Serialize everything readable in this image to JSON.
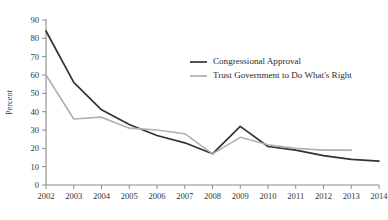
{
  "chart_data": {
    "type": "line",
    "title": "",
    "xlabel": "",
    "ylabel": "Percent",
    "x": [
      2002,
      2003,
      2004,
      2005,
      2006,
      2007,
      2008,
      2009,
      2010,
      2011,
      2012,
      2013,
      2014
    ],
    "xtick_labels": [
      "2002",
      "2003",
      "2004",
      "2005",
      "2006",
      "2007",
      "2008",
      "2009",
      "2010",
      "2011",
      "2012",
      "2013",
      "2014"
    ],
    "ytick_labels": [
      "0",
      "10",
      "20",
      "30",
      "40",
      "50",
      "60",
      "70",
      "80",
      "90"
    ],
    "yticks": [
      0,
      10,
      20,
      30,
      40,
      50,
      60,
      70,
      80,
      90
    ],
    "ylim": [
      0,
      90
    ],
    "xlim": [
      2002,
      2014
    ],
    "grid": false,
    "legend_position": "upper-right-inside",
    "series": [
      {
        "name": "Congressional Approval",
        "color": "#333333",
        "width": 1.7,
        "values": [
          84,
          56,
          41,
          33,
          27,
          23,
          17,
          32,
          21,
          19,
          16,
          14,
          13
        ]
      },
      {
        "name": "Trust Government to Do What's Right",
        "color": "#b0b0b0",
        "width": 1.6,
        "values": [
          60,
          36,
          37,
          31,
          30,
          28,
          17,
          26,
          22,
          20,
          19,
          19,
          null
        ]
      }
    ]
  },
  "legend": {
    "items": [
      {
        "label": "Congressional Approval",
        "color": "#333333"
      },
      {
        "label": "Trust Government to Do What's Right",
        "color": "#b0b0b0"
      }
    ]
  }
}
